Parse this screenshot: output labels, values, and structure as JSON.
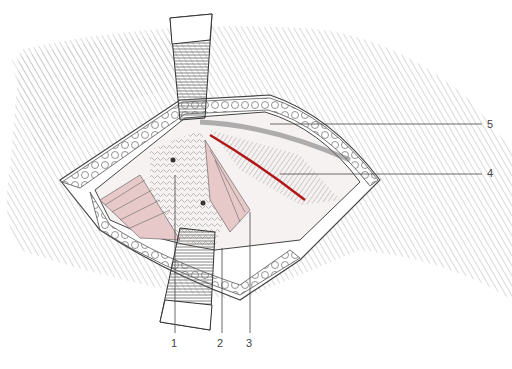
{
  "figure": {
    "type": "surgical illustration",
    "colors": {
      "artery": "#b01818",
      "muscle_tint": "#e8c9c9",
      "ink": "#333333",
      "background": "#ffffff"
    },
    "labels": [
      {
        "id": "1",
        "text": "1"
      },
      {
        "id": "2",
        "text": "2"
      },
      {
        "id": "3",
        "text": "3"
      },
      {
        "id": "4",
        "text": "4"
      },
      {
        "id": "5",
        "text": "5"
      }
    ]
  }
}
